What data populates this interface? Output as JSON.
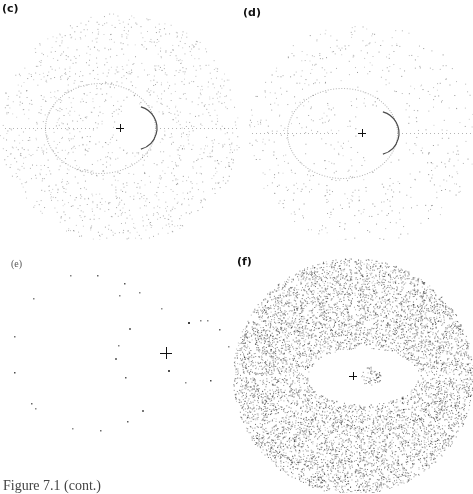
{
  "figure": {
    "caption": "Figure 7.1 (cont.)",
    "panels": [
      {
        "id": "c",
        "label": "(c)",
        "description": "Dense radial dot pattern around central cross with an ellipse-like orbit; darker arc right of center",
        "density": "medium"
      },
      {
        "id": "d",
        "label": "(d)",
        "description": "Sparser dot pattern with looping curves around central cross; dark arc right of center",
        "density": "low-medium"
      },
      {
        "id": "e",
        "label": "(e)",
        "description": "Very sparse scattered dots around central cross",
        "density": "sparse"
      },
      {
        "id": "f",
        "label": "(f)",
        "description": "Very dense dot field with radial and curved gaps around central cross",
        "density": "high"
      }
    ],
    "center_marker": "+"
  }
}
